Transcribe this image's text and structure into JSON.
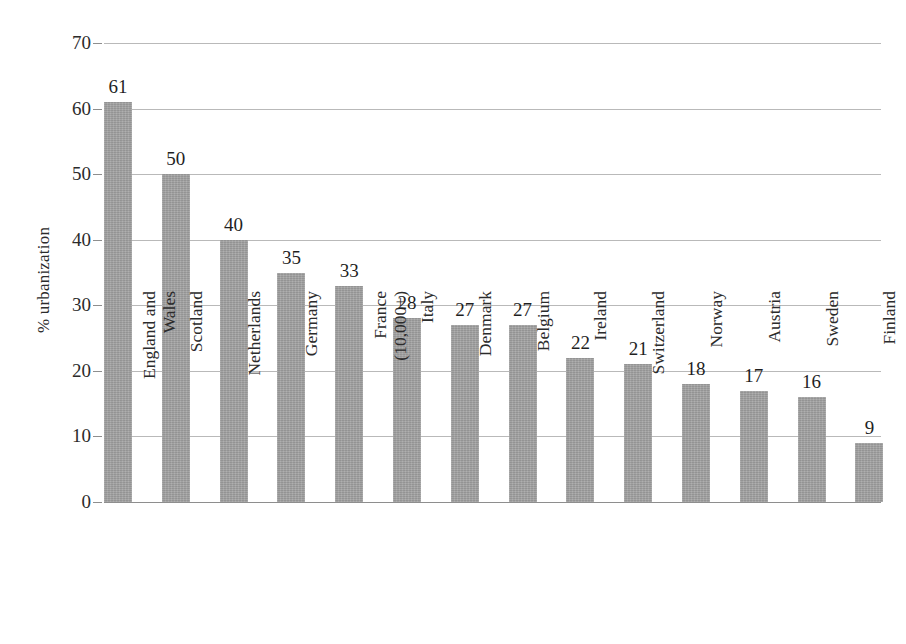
{
  "chart_data": {
    "type": "bar",
    "title": "",
    "subtitle": "",
    "xlabel": "",
    "ylabel": "% urbanization",
    "ylim": [
      0,
      70
    ],
    "ytick_values": [
      0,
      10,
      20,
      30,
      40,
      50,
      60,
      70
    ],
    "ytick_labels": [
      "0",
      "10",
      "20",
      "30",
      "40",
      "50",
      "60",
      "70"
    ],
    "grid": true,
    "legend": "none",
    "bar_color": "#a0a0a0",
    "gridline_color": "#b9b9b9",
    "axis_color": "#8e8e8e",
    "text_color": "#2b2b2b",
    "categories": [
      "England and Wales",
      "Scotland",
      "Netherlands",
      "Germany",
      "France (10,000+)",
      "Italy",
      "Denmark",
      "Belgium",
      "Ireland",
      "Switzerland",
      "Norway",
      "Austria",
      "Sweden",
      "Finland"
    ],
    "category_lines": [
      [
        "England and",
        "Wales"
      ],
      [
        "Scotland",
        ""
      ],
      [
        "Netherlands",
        ""
      ],
      [
        "Germany",
        ""
      ],
      [
        "France",
        "(10,000+)"
      ],
      [
        "Italy",
        ""
      ],
      [
        "Denmark",
        ""
      ],
      [
        "Belgium",
        ""
      ],
      [
        "Ireland",
        ""
      ],
      [
        "Switzerland",
        ""
      ],
      [
        "Norway",
        ""
      ],
      [
        "Austria",
        ""
      ],
      [
        "Sweden",
        ""
      ],
      [
        "Finland",
        ""
      ]
    ],
    "values": [
      61,
      50,
      40,
      35,
      33,
      28,
      27,
      27,
      22,
      21,
      18,
      17,
      16,
      9
    ],
    "value_labels": [
      "61",
      "50",
      "40",
      "35",
      "33",
      "28",
      "27",
      "27",
      "22",
      "21",
      "18",
      "17",
      "16",
      "9"
    ]
  }
}
